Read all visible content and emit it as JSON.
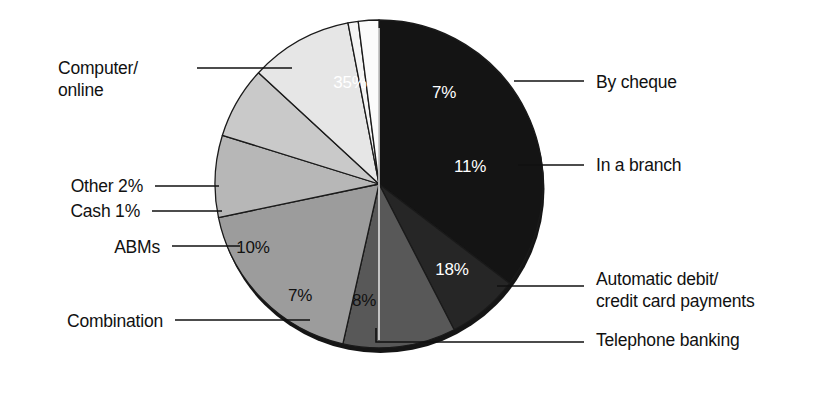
{
  "figure": {
    "background_color": "#ffffff",
    "text_color": "#111111",
    "outline_color": "#1a1a1a"
  },
  "chart_data": {
    "type": "pie",
    "title": "",
    "subtitle": "",
    "xlabel": "",
    "ylabel": "",
    "legend_position": "callout-labels",
    "grid": false,
    "units": "percent",
    "total": 99,
    "start_angle_deg": -90,
    "direction": "clockwise",
    "categories": [
      "Computer/ online",
      "By cheque",
      "In a branch",
      "Automatic debit/ credit card payments",
      "Telephone banking",
      "Combination",
      "ABMs",
      "Cash",
      "Other"
    ],
    "values": [
      35,
      7,
      11,
      18,
      8,
      7,
      10,
      1,
      2
    ],
    "slices": [
      {
        "label": "Computer/\nonline",
        "label_line1": "Computer/",
        "label_line2": "online",
        "value": 35,
        "value_label": "35%",
        "color": "#141414",
        "value_text_color": "#ffffff",
        "value_x": 350,
        "value_y": 88,
        "label_x": 58,
        "label_y": 74,
        "leader": "M 197 68 L 292 68",
        "leader_style": "straight"
      },
      {
        "label": "By cheque",
        "value": 7,
        "value_label": "7%",
        "color": "#262626",
        "value_text_color": "#ffffff",
        "value_x": 444,
        "value_y": 98,
        "label_x": 596,
        "label_y": 88,
        "leader": "M 514 81 L 584 81",
        "leader_style": "straight"
      },
      {
        "label": "In a branch",
        "value": 11,
        "value_label": "11%",
        "color": "#585858",
        "value_text_color": "#ffffff",
        "value_x": 470,
        "value_y": 172,
        "label_x": 596,
        "label_y": 171,
        "leader": "M 518 165 L 584 165",
        "leader_style": "straight"
      },
      {
        "label": "Automatic debit/\ncredit card payments",
        "label_line1": "Automatic debit/",
        "label_line2": "credit card payments",
        "value": 18,
        "value_label": "18%",
        "color": "#9c9c9c",
        "value_text_color": "#ffffff",
        "value_x": 452,
        "value_y": 275,
        "label_x": 596,
        "label_y": 285,
        "leader": "M 497 286 L 584 286",
        "leader_style": "straight"
      },
      {
        "label": "Telephone banking",
        "value": 8,
        "value_label": "8%",
        "color": "#b7b7b7",
        "value_text_color": "#111111",
        "value_x": 364,
        "value_y": 306,
        "label_x": 596,
        "label_y": 346,
        "leader": "M 376 328 L 376 342 L 584 342",
        "leader_style": "elbow"
      },
      {
        "label": "Combination",
        "value": 7,
        "value_label": "7%",
        "color": "#c9c9c9",
        "value_text_color": "#111111",
        "value_x": 300,
        "value_y": 301,
        "label_x": 28,
        "label_y": 327,
        "leader": "M 175 320 L 310 320",
        "leader_style": "straight"
      },
      {
        "label": "ABMs",
        "value": 10,
        "value_label": "10%",
        "color": "#e6e6e6",
        "value_text_color": "#111111",
        "value_x": 253,
        "value_y": 253,
        "label_x": 94,
        "label_y": 253,
        "leader": "M 172 246 L 240 246",
        "leader_style": "straight"
      },
      {
        "label": "Cash 1%",
        "value": 1,
        "value_label": "1%",
        "color": "#f4f4f4",
        "value_text_color": "#111111",
        "value_x": 0,
        "value_y": 0,
        "label_x": 70,
        "label_y": 217,
        "leader": "M 152 211 L 222 211",
        "leader_style": "straight"
      },
      {
        "label": "Other 2%",
        "value": 2,
        "value_label": "2%",
        "color": "#fbfbfb",
        "value_text_color": "#111111",
        "value_x": 0,
        "value_y": 0,
        "label_x": 70,
        "label_y": 192,
        "leader": "M 155 186 L 219 186",
        "leader_style": "straight"
      }
    ],
    "geometry": {
      "center_x": 379,
      "center_y": 184,
      "radius": 164,
      "depth": 5
    }
  }
}
